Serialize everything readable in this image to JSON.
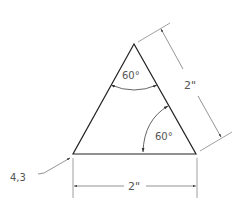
{
  "diagram": {
    "type": "technical-drawing",
    "shape": "equilateral-triangle",
    "vertices": {
      "apex": [
        134,
        44
      ],
      "bottom_left": [
        73,
        154
      ],
      "bottom_right": [
        196,
        154
      ]
    },
    "labels": {
      "top_angle": "60°",
      "right_angle": "60°",
      "side_dimension": "2\"",
      "base_dimension": "2\"",
      "origin_coordinate": "4,3"
    },
    "colors": {
      "outline": "#222222",
      "dimension": "#666666",
      "text": "#555555"
    }
  }
}
